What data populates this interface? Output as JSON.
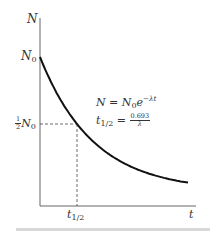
{
  "chart_data": {
    "type": "line",
    "title": "",
    "xlabel": "t",
    "ylabel": "N",
    "x_ticks": [
      "t_1/2"
    ],
    "y_ticks": [
      "N_0",
      "1/2 N_0"
    ],
    "series": [
      {
        "name": "N = N0 e^(-λt)",
        "x": [
          0,
          0.5,
          1,
          1.5,
          2,
          2.5,
          3,
          3.5,
          4
        ],
        "values": [
          1.0,
          0.707,
          0.5,
          0.354,
          0.25,
          0.177,
          0.125,
          0.088,
          0.0625
        ]
      }
    ],
    "annotations": [
      {
        "text": "N = N_0 e^(-λt)",
        "type": "equation"
      },
      {
        "text": "t_1/2 = 0.693/λ",
        "type": "equation"
      },
      {
        "text": "dashed guide from (0, N_0/2) to (t_1/2, N_0/2) and down to x-axis",
        "type": "guide"
      }
    ],
    "grid": false,
    "legend": "none"
  },
  "labels": {
    "y_axis": "N",
    "x_axis": "t",
    "n0": "N",
    "n0_sub": "0",
    "half_num": "1",
    "half_den": "2",
    "half_n": "N",
    "half_n_sub": "0",
    "thalf": "t",
    "thalf_sub": "1/2",
    "eq1_lhs": "N = N",
    "eq1_sub": "0",
    "eq1_e": "e",
    "eq1_exp": "−λt",
    "eq2_t": "t",
    "eq2_sub": "1/2",
    "eq2_eq": " = ",
    "eq2_num": "0.693",
    "eq2_den": "λ"
  }
}
